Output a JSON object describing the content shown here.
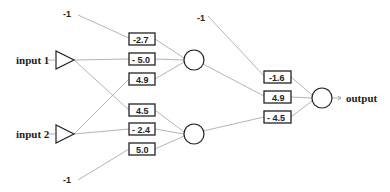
{
  "inputs": [
    {
      "label": "input 1"
    },
    {
      "label": "input 2"
    }
  ],
  "biases": [
    {
      "label": "-1",
      "target": "hidden-1"
    },
    {
      "label": "-1",
      "target": "hidden-2"
    },
    {
      "label": "-1",
      "target": "output"
    }
  ],
  "hidden": [
    {
      "name": "hidden-1",
      "weights": [
        {
          "from": "bias",
          "value": "-2.7"
        },
        {
          "from": "input 1",
          "value": "- 5.0"
        },
        {
          "from": "input 2",
          "value": "4.9"
        }
      ]
    },
    {
      "name": "hidden-2",
      "weights": [
        {
          "from": "input 1",
          "value": "4.5"
        },
        {
          "from": "input 2",
          "value": "- 2.4"
        },
        {
          "from": "bias",
          "value": "5.0"
        }
      ]
    }
  ],
  "output": {
    "label": "output",
    "weights": [
      {
        "from": "bias",
        "value": "-1.6"
      },
      {
        "from": "hidden-1",
        "value": "4.9"
      },
      {
        "from": "hidden-2",
        "value": "- 4.5"
      }
    ]
  },
  "colors": {
    "stroke": "#222222",
    "edge": "#b5b5b5",
    "background": "#ffffff"
  }
}
